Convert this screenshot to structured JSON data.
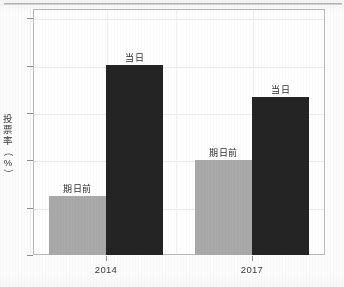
{
  "chart_data": {
    "type": "bar",
    "title": "",
    "xlabel": "",
    "ylabel": "投票率（%）",
    "ylabel_chars": [
      "投",
      "票",
      "率",
      "（",
      "%",
      "）"
    ],
    "categories": [
      "2014",
      "2017"
    ],
    "ylim": [
      0,
      52
    ],
    "yticks": [
      0,
      10,
      20,
      30,
      40,
      50
    ],
    "ytick_labels": [
      "0",
      "10",
      "20",
      "30",
      "40",
      "50"
    ],
    "grid": true,
    "legend": "inline-bar-labels",
    "series": [
      {
        "name": "期日前",
        "color": "#a9a9a9",
        "values": [
          12.4,
          20.0
        ]
      },
      {
        "name": "当日",
        "color": "#242424",
        "values": [
          40.1,
          33.3
        ]
      }
    ],
    "bar_labels": [
      {
        "text": "期日前",
        "category": "2014",
        "series": "期日前"
      },
      {
        "text": "当日",
        "category": "2014",
        "series": "当日"
      },
      {
        "text": "期日前",
        "category": "2017",
        "series": "期日前"
      },
      {
        "text": "当日",
        "category": "2017",
        "series": "当日"
      }
    ]
  }
}
